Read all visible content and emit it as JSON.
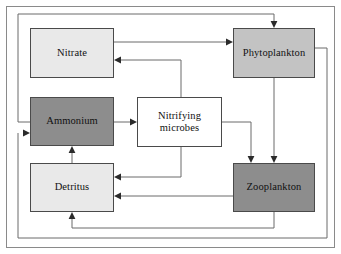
{
  "diagram": {
    "type": "flow-diagram",
    "width": 341,
    "height": 254,
    "background_color": "#ffffff",
    "border_color": "#8a8a8a",
    "edge_color": "#6a6a6a",
    "arrowhead_color": "#2b2b2b"
  },
  "legend_colors": {
    "light_gray": "#e9e9e9",
    "medium_gray": "#c3c3c3",
    "dark_gray": "#8d8d8d",
    "white": "#ffffff",
    "box_border": "#4a4a4a"
  },
  "nodes": [
    {
      "id": "nitrate",
      "label": "Nitrate",
      "fill": "light",
      "x": 30,
      "y": 28,
      "width": 84,
      "height": 50
    },
    {
      "id": "phytoplankton",
      "label": "Phytoplankton",
      "fill": "medium",
      "x": 233,
      "y": 28,
      "width": 82,
      "height": 50
    },
    {
      "id": "ammonium",
      "label": "Ammonium",
      "fill": "dark",
      "x": 30,
      "y": 97,
      "width": 84,
      "height": 49
    },
    {
      "id": "nitrifying_microbes",
      "label": "Nitrifying\nmicrobes",
      "fill": "white",
      "x": 137,
      "y": 97,
      "width": 85,
      "height": 50
    },
    {
      "id": "detritus",
      "label": "Detritus",
      "fill": "light",
      "x": 30,
      "y": 163,
      "width": 84,
      "height": 49
    },
    {
      "id": "zooplankton",
      "label": "Zooplankton",
      "fill": "dark",
      "x": 233,
      "y": 163,
      "width": 82,
      "height": 49
    }
  ],
  "edges": [
    {
      "id": "nitrate-to-phytoplankton",
      "from": "nitrate",
      "to": "phytoplankton"
    },
    {
      "id": "nitrifying-to-nitrate",
      "from": "nitrifying_microbes",
      "to": "nitrate"
    },
    {
      "id": "ammonium-to-nitrifying",
      "from": "ammonium",
      "to": "nitrifying_microbes"
    },
    {
      "id": "ammonium-to-phytoplankton",
      "from": "ammonium",
      "to": "phytoplankton"
    },
    {
      "id": "detritus-to-ammonium",
      "from": "detritus",
      "to": "ammonium"
    },
    {
      "id": "nitrifying-to-detritus",
      "from": "nitrifying_microbes",
      "to": "detritus"
    },
    {
      "id": "nitrifying-to-zooplankton",
      "from": "nitrifying_microbes",
      "to": "zooplankton"
    },
    {
      "id": "phytoplankton-to-zooplankton",
      "from": "phytoplankton",
      "to": "zooplankton"
    },
    {
      "id": "zooplankton-to-detritus",
      "from": "zooplankton",
      "to": "detritus"
    },
    {
      "id": "zooplankton-to-detritus-bottom",
      "from": "zooplankton",
      "to": "detritus"
    },
    {
      "id": "phytoplankton-to-ammonium-loop",
      "from": "phytoplankton",
      "to": "ammonium"
    }
  ]
}
